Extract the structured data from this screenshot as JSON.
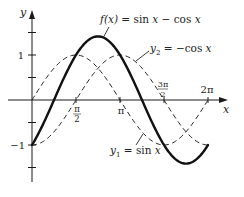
{
  "chart_data": {
    "type": "line",
    "title": "",
    "xlabel": "x",
    "ylabel": "y",
    "xlim": [
      0,
      6.283
    ],
    "ylim": [
      -1.7,
      1.7
    ],
    "grid": false,
    "legend": "inline annotations",
    "x_ticks": [
      {
        "value": 1.5708,
        "label_num": "π",
        "label_den": "2"
      },
      {
        "value": 3.1416,
        "label": "π"
      },
      {
        "value": 4.7124,
        "label_num": "3π",
        "label_den": "2"
      },
      {
        "value": 6.2832,
        "label": "2π"
      }
    ],
    "y_ticks": [
      {
        "value": 1.5,
        "label": ""
      },
      {
        "value": 1,
        "label": "1"
      },
      {
        "value": 0.5,
        "label": ""
      },
      {
        "value": -0.5,
        "label": ""
      },
      {
        "value": -1,
        "label": "−1"
      },
      {
        "value": -1.5,
        "label": ""
      }
    ],
    "series": [
      {
        "name": "f(x) = sin x − cos x",
        "style": "solid-thick",
        "x": [
          0,
          0.7854,
          1.5708,
          2.3562,
          3.1416,
          3.927,
          4.7124,
          5.4978,
          6.2832
        ],
        "values": [
          -1,
          0,
          1,
          1.414,
          1,
          0,
          -1,
          -1.414,
          -1
        ]
      },
      {
        "name": "y1 = sin x",
        "style": "dashed",
        "x": [
          0,
          0.7854,
          1.5708,
          2.3562,
          3.1416,
          3.927,
          4.7124,
          5.4978,
          6.2832
        ],
        "values": [
          0,
          0.707,
          1,
          0.707,
          0,
          -0.707,
          -1,
          -0.707,
          0
        ]
      },
      {
        "name": "y2 = −cos x",
        "style": "dashed",
        "x": [
          0,
          0.7854,
          1.5708,
          2.3562,
          3.1416,
          3.927,
          4.7124,
          5.4978,
          6.2832
        ],
        "values": [
          -1,
          -0.707,
          0,
          0.707,
          1,
          0.707,
          0,
          -0.707,
          -1
        ]
      }
    ],
    "annotations": [
      {
        "text_italic": "f(x)",
        "text_rest": " = sin ",
        "text_var": "x",
        "text_rest2": " − cos ",
        "text_var2": "x",
        "points_to": "f(x) near maximum"
      },
      {
        "text_italic": "y",
        "sub": "2",
        "text_rest": " = −cos ",
        "text_var": "x",
        "points_to": "y2 curve"
      },
      {
        "text_italic": "y",
        "sub": "1",
        "text_rest": " = sin ",
        "text_var": "x",
        "points_to": "y1 curve"
      }
    ]
  },
  "axes": {
    "x_label": "x",
    "y_label": "y"
  }
}
